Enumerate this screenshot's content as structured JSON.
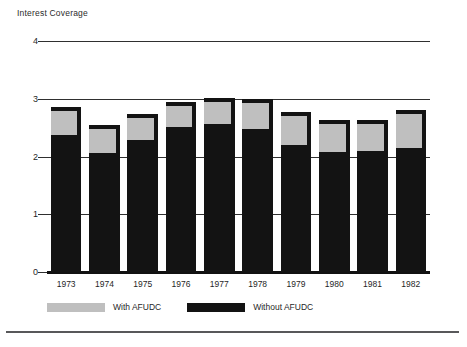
{
  "chart_data": {
    "type": "bar",
    "title": "Interest Coverage",
    "xlabel": "",
    "ylabel": "Interest Coverage",
    "ylim": [
      0,
      4
    ],
    "yticks": [
      0,
      1,
      2,
      3,
      4
    ],
    "ytick_labels": [
      "0",
      "1",
      "2",
      "3",
      "4"
    ],
    "grid": true,
    "legend_position": "bottom-left",
    "stacked": true,
    "categories": [
      "1973",
      "1974",
      "1975",
      "1976",
      "1977",
      "1978",
      "1979",
      "1980",
      "1981",
      "1982"
    ],
    "series": [
      {
        "name": "With AFUDC",
        "color": "#bfbfbf",
        "values": [
          2.85,
          2.55,
          2.74,
          2.95,
          3.01,
          3.0,
          2.77,
          2.63,
          2.64,
          2.81
        ]
      },
      {
        "name": "Without AFUDC",
        "color": "#131313",
        "values": [
          2.37,
          2.06,
          2.29,
          2.51,
          2.56,
          2.48,
          2.2,
          2.07,
          2.09,
          2.15
        ]
      }
    ]
  },
  "axis": {
    "title": "Interest Coverage"
  },
  "legend": {
    "items": [
      {
        "label": "With AFUDC",
        "swatch": "gray"
      },
      {
        "label": "Without AFUDC",
        "swatch": "black"
      }
    ]
  }
}
